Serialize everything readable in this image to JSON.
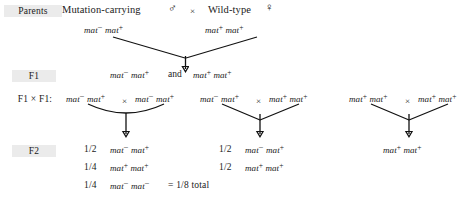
{
  "diagram": {
    "ink_color": "#111111",
    "label_highlight_color": "#ebebeb"
  },
  "rows": {
    "parents_label": "Parents",
    "f1_label": "F1",
    "f1xf1_label": "F1 × F1:",
    "f2_label": "F2"
  },
  "parents": {
    "left_phenotype": "Mutation-carrying",
    "left_sex_symbol": "♂",
    "left_sex_name": "male-symbol",
    "cross_symbol": "×",
    "right_phenotype": "Wild-type",
    "right_sex_symbol": "♀",
    "right_sex_name": "female-symbol",
    "left_genotype": {
      "allele1": "mat",
      "allele1_sup": "−",
      "allele2": "mat",
      "allele2_sup": "+"
    },
    "right_genotype": {
      "allele1": "mat",
      "allele1_sup": "+",
      "allele2": "mat",
      "allele2_sup": "+"
    }
  },
  "f1": {
    "genotype_a": {
      "allele1": "mat",
      "allele1_sup": "−",
      "allele2": "mat",
      "allele2_sup": "+"
    },
    "conjunction": "and",
    "genotype_b": {
      "allele1": "mat",
      "allele1_sup": "+",
      "allele2": "mat",
      "allele2_sup": "+"
    }
  },
  "crosses": [
    {
      "id": "cross-1",
      "cross_symbol": "×",
      "parent_left": {
        "allele1": "mat",
        "allele1_sup": "−",
        "allele2": "mat",
        "allele2_sup": "+"
      },
      "parent_right": {
        "allele1": "mat",
        "allele1_sup": "−",
        "allele2": "mat",
        "allele2_sup": "+"
      },
      "offspring": [
        {
          "fraction": "1/2",
          "genotype": {
            "allele1": "mat",
            "allele1_sup": "−",
            "allele2": "mat",
            "allele2_sup": "+"
          },
          "note": ""
        },
        {
          "fraction": "1/4",
          "genotype": {
            "allele1": "mat",
            "allele1_sup": "+",
            "allele2": "mat",
            "allele2_sup": "+"
          },
          "note": ""
        },
        {
          "fraction": "1/4",
          "genotype": {
            "allele1": "mat",
            "allele1_sup": "−",
            "allele2": "mat",
            "allele2_sup": "−"
          },
          "note": "= 1/8 total"
        }
      ]
    },
    {
      "id": "cross-2",
      "cross_symbol": "×",
      "parent_left": {
        "allele1": "mat",
        "allele1_sup": "−",
        "allele2": "mat",
        "allele2_sup": "+"
      },
      "parent_right": {
        "allele1": "mat",
        "allele1_sup": "+",
        "allele2": "mat",
        "allele2_sup": "+"
      },
      "offspring": [
        {
          "fraction": "1/2",
          "genotype": {
            "allele1": "mat",
            "allele1_sup": "−",
            "allele2": "mat",
            "allele2_sup": "+"
          },
          "note": ""
        },
        {
          "fraction": "1/2",
          "genotype": {
            "allele1": "mat",
            "allele1_sup": "+",
            "allele2": "mat",
            "allele2_sup": "+"
          },
          "note": ""
        }
      ]
    },
    {
      "id": "cross-3",
      "cross_symbol": "×",
      "parent_left": {
        "allele1": "mat",
        "allele1_sup": "+",
        "allele2": "mat",
        "allele2_sup": "+"
      },
      "parent_right": {
        "allele1": "mat",
        "allele1_sup": "+",
        "allele2": "mat",
        "allele2_sup": "+"
      },
      "offspring": [
        {
          "fraction": "",
          "genotype": {
            "allele1": "mat",
            "allele1_sup": "+",
            "allele2": "mat",
            "allele2_sup": "+"
          },
          "note": ""
        }
      ]
    }
  ]
}
